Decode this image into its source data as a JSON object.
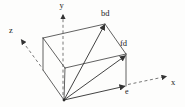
{
  "diagram": {
    "kind": "3d-box-vector-diagram",
    "axis_labels": {
      "x": "x",
      "y": "y",
      "z": "z"
    },
    "vector_labels": {
      "body_diagonal": "bd",
      "face_diagonal": "fd",
      "edge": "e"
    },
    "colors": {
      "background": "#fdfdfc",
      "edge": "#3a3a3a",
      "vector": "#2e2e2e",
      "axis": "#565656",
      "label": "#1c1c1c"
    }
  }
}
